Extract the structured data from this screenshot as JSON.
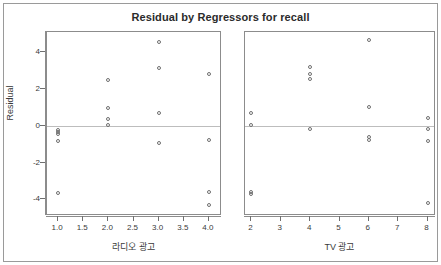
{
  "chart_data": {
    "type": "scatter",
    "title": "Residual by Regressors for recall",
    "ylabel": "Residual",
    "ylim": [
      -4.9,
      5.1
    ],
    "yticks": [
      -4,
      -2,
      0,
      2,
      4
    ],
    "ytick_labels": [
      "-4",
      "-2",
      "0",
      "2",
      "4"
    ],
    "grid": false,
    "legend": null,
    "reference_line": {
      "y": 0,
      "color": "#bdbdbd"
    },
    "marker": {
      "shape": "open-circle",
      "color": "#6f6f6f",
      "size": 4
    },
    "panels": [
      {
        "name": "radio-panel",
        "xlabel": "라디오 광고",
        "xlim": [
          0.78,
          4.22
        ],
        "xticks": [
          1.0,
          1.5,
          2.0,
          2.5,
          3.0,
          3.5,
          4.0
        ],
        "xtick_labels": [
          "1.0",
          "1.5",
          "2.0",
          "2.5",
          "3.0",
          "3.5",
          "4.0"
        ],
        "points": [
          {
            "x": 1.0,
            "y": -0.22
          },
          {
            "x": 1.0,
            "y": -0.32
          },
          {
            "x": 1.0,
            "y": -0.42
          },
          {
            "x": 1.0,
            "y": -0.8
          },
          {
            "x": 1.0,
            "y": -3.65
          },
          {
            "x": 2.0,
            "y": 2.5
          },
          {
            "x": 2.0,
            "y": 0.95
          },
          {
            "x": 2.0,
            "y": 0.35
          },
          {
            "x": 2.0,
            "y": 0.02
          },
          {
            "x": 3.0,
            "y": 4.58
          },
          {
            "x": 3.0,
            "y": 3.15
          },
          {
            "x": 3.0,
            "y": 0.7
          },
          {
            "x": 3.0,
            "y": -0.95
          },
          {
            "x": 4.0,
            "y": 2.82
          },
          {
            "x": 4.0,
            "y": -0.78
          },
          {
            "x": 4.0,
            "y": -3.62
          },
          {
            "x": 4.0,
            "y": -4.3
          }
        ]
      },
      {
        "name": "tv-panel",
        "xlabel": "TV 광고",
        "xlim": [
          1.78,
          8.22
        ],
        "xticks": [
          2,
          3,
          4,
          5,
          6,
          7,
          8
        ],
        "xtick_labels": [
          "2",
          "3",
          "4",
          "5",
          "6",
          "7",
          "8"
        ],
        "points": [
          {
            "x": 2,
            "y": 0.72
          },
          {
            "x": 2,
            "y": 0.05
          },
          {
            "x": 2,
            "y": -3.58
          },
          {
            "x": 2,
            "y": -3.68
          },
          {
            "x": 4,
            "y": 3.2
          },
          {
            "x": 4,
            "y": 2.8
          },
          {
            "x": 4,
            "y": 2.52
          },
          {
            "x": 4,
            "y": -0.15
          },
          {
            "x": 6,
            "y": 4.65
          },
          {
            "x": 6,
            "y": 1.02
          },
          {
            "x": 6,
            "y": -0.62
          },
          {
            "x": 6,
            "y": -0.75
          },
          {
            "x": 8,
            "y": 0.45
          },
          {
            "x": 8,
            "y": -0.18
          },
          {
            "x": 8,
            "y": -0.85
          },
          {
            "x": 8,
            "y": -4.22
          }
        ]
      }
    ]
  }
}
